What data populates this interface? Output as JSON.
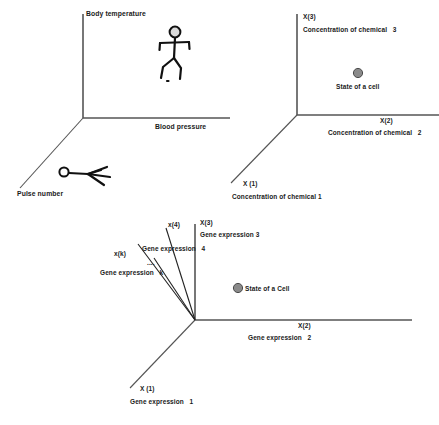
{
  "figure": {
    "panels": [
      {
        "id": "physiological-state-space",
        "axes": {
          "vertical_label": "Body temperature",
          "horizontal_label": "Blood pressure",
          "diagonal_label": "Pulse number"
        },
        "figures": [
          {
            "name": "running-person-upright"
          },
          {
            "name": "running-person-projected"
          }
        ]
      },
      {
        "id": "chemical-concentration-state-space",
        "axes": {
          "x3_name": "X(3)",
          "x3_desc": "Concentration of chemical   3",
          "x2_name": "X(2)",
          "x2_desc": "Concentration of chemical   2",
          "x1_name": "X (1)",
          "x1_desc": "Concentration of chemical 1"
        },
        "point": {
          "label": "State of a cell"
        }
      },
      {
        "id": "gene-expression-state-space",
        "axes": {
          "x3_name": "X(3)",
          "x3_desc": "Gene expression 3",
          "x4_name": "x(4)",
          "x4_desc": "Gene expression   4",
          "xk_name": "x(k)",
          "xk_desc": "Gene expression   k",
          "ellipsis": "....",
          "x2_name": "X(2)",
          "x2_desc": "Gene expression   2",
          "x1_name": "X (1)",
          "x1_desc": "Gene expression   1"
        },
        "point": {
          "label": "State of a Cell"
        }
      }
    ],
    "colors": {
      "axis": "#555555",
      "dot_fill": "#8a8a8a",
      "dot_stroke": "#4a4a4a",
      "text": "#1a1a1a"
    }
  }
}
